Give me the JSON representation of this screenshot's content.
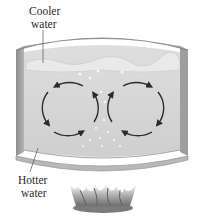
{
  "diagram": {
    "labels": {
      "cooler": [
        "Cooler",
        "water"
      ],
      "hotter": [
        "Hotter",
        "water"
      ]
    },
    "convection_cells": [
      {
        "name": "left-cell",
        "rotation": "counter-clockwise"
      },
      {
        "name": "right-cell",
        "rotation": "clockwise"
      }
    ],
    "heat_source": "flame-icon",
    "colors": {
      "pot_wall": "#9a9a9a",
      "pot_rim": "#bdbdbd",
      "water": "#d6d6d6",
      "water_surface": "#e8e8e8",
      "arrow": "#2b2b2b",
      "bubble": "#f6f6f6",
      "flame": "#8a8a8a"
    }
  }
}
